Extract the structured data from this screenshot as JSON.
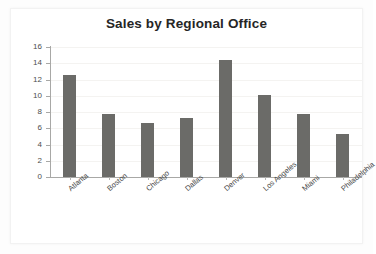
{
  "chart_data": {
    "type": "bar",
    "title": "Sales by Regional Office",
    "xlabel": "",
    "ylabel": "",
    "categories": [
      "Atlanta",
      "Boston",
      "Chicago",
      "Dallas",
      "Denver",
      "Los Angeles",
      "Miami",
      "Philadelphia"
    ],
    "values": [
      12.5,
      7.75,
      6.7,
      7.25,
      14.4,
      10.1,
      7.75,
      5.3
    ],
    "ylim": [
      0,
      16
    ],
    "ytick_values": [
      0,
      2,
      4,
      6,
      8,
      10,
      12,
      14,
      16
    ],
    "ytick_labels": [
      "0",
      "2",
      "4",
      "6",
      "8",
      "10",
      "12",
      "14",
      "16"
    ],
    "grid": true,
    "legend": false,
    "bar_color": "#6b6b68",
    "title_color": "#262626",
    "axis_color": "#a8a8a6",
    "gridline_color": "#f4f3f1",
    "background_color": "#ffffff",
    "xtick_label_rotation": -40
  }
}
